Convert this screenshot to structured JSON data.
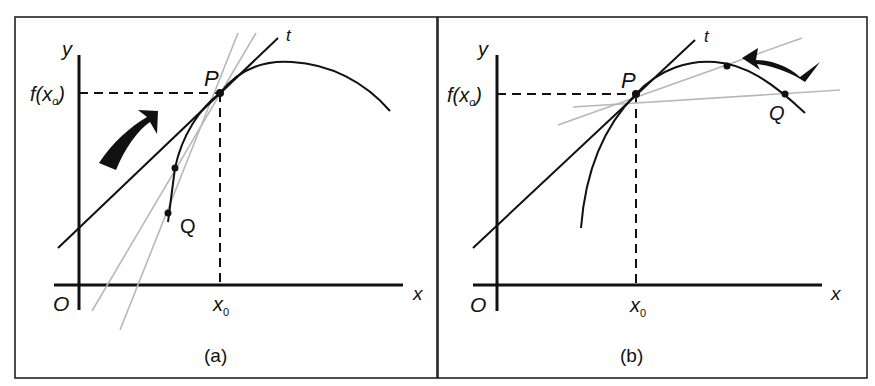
{
  "figure": {
    "panels": [
      {
        "id": "a",
        "caption": "(a)",
        "labels": {
          "y_axis": "y",
          "x_axis": "x",
          "origin": "O",
          "fx0": "f(x",
          "fx0_sub": "o",
          "fx0_close": ")",
          "x0": "x",
          "x0_sub": "0",
          "point_p": "P",
          "point_q": "Q",
          "tangent": "t"
        },
        "note": "Q approaches P from the left along the curve; secants (gray) approach tangent t"
      },
      {
        "id": "b",
        "caption": "(b)",
        "labels": {
          "y_axis": "y",
          "x_axis": "x",
          "origin": "O",
          "fx0": "f(x",
          "fx0_sub": "o",
          "fx0_close": ")",
          "x0": "x",
          "x0_sub": "0",
          "point_p": "P",
          "point_q": "Q",
          "tangent": "t"
        },
        "note": "Q approaches P from the right along the curve; secants (gray) approach tangent t"
      }
    ],
    "colors": {
      "ink": "#111111",
      "secant": "#b8b8b8",
      "frame": "#222222",
      "background": "#ffffff"
    }
  }
}
